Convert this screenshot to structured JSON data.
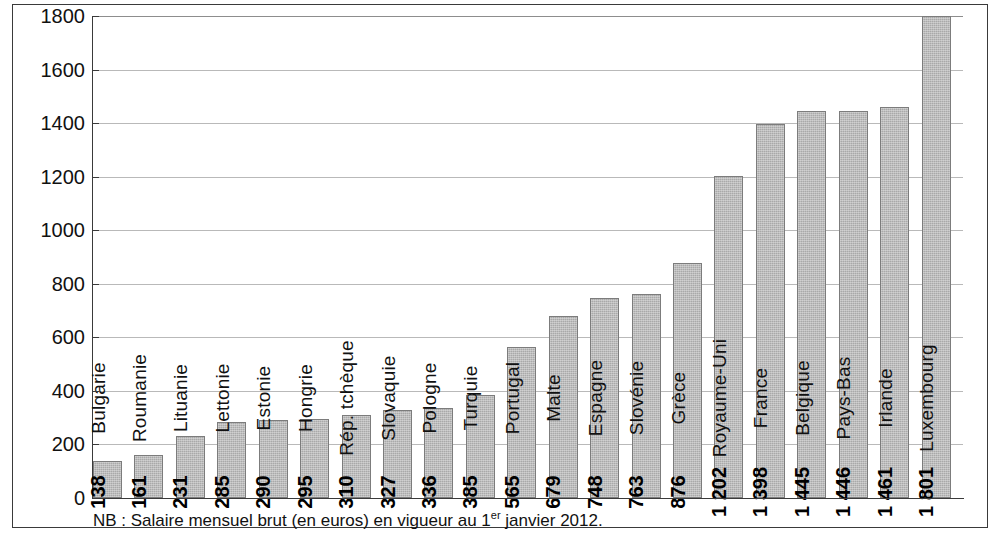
{
  "chart_data": {
    "type": "bar",
    "title": "",
    "subtitle": "",
    "xlabel": "",
    "ylabel": "",
    "ylim": [
      0,
      1800
    ],
    "ytick_step": 200,
    "yticks": [
      1800,
      1600,
      1400,
      1200,
      1000,
      800,
      600,
      400,
      200,
      0
    ],
    "ytick_labels": [
      "1800",
      "1600",
      "1400",
      "1200",
      "1000",
      "800",
      "600",
      "400",
      "200",
      "0"
    ],
    "grid": true,
    "grid_axis": "y",
    "legend": false,
    "bar_color": "#a9a9a9",
    "bar_edge_color": "#7c7c7c",
    "categories": [
      "Bulgarie",
      "Roumanie",
      "Lituanie",
      "Lettonie",
      "Estonie",
      "Hongrie",
      "Rép. tchèque",
      "Slovaquie",
      "Pologne",
      "Turquie",
      "Portugal",
      "Malte",
      "Espagne",
      "Slovénie",
      "Grèce",
      "Royaume-Uni",
      "France",
      "Belgique",
      "Pays-Bas",
      "Irlande",
      "Luxembourg"
    ],
    "values": [
      138,
      161,
      231,
      285,
      290,
      295,
      310,
      327,
      336,
      385,
      565,
      679,
      748,
      763,
      876,
      1202,
      1398,
      1445,
      1446,
      1461,
      1801
    ],
    "value_labels": [
      "138",
      "161",
      "231",
      "285",
      "290",
      "295",
      "310",
      "327",
      "336",
      "385",
      "565",
      "679",
      "748",
      "763",
      "876",
      "1 202",
      "1 398",
      "1 445",
      "1 446",
      "1 461",
      "1 801"
    ],
    "bars": [
      {
        "category": "Bulgarie",
        "value": 138,
        "label": "138"
      },
      {
        "category": "Roumanie",
        "value": 161,
        "label": "161"
      },
      {
        "category": "Lituanie",
        "value": 231,
        "label": "231"
      },
      {
        "category": "Lettonie",
        "value": 285,
        "label": "285"
      },
      {
        "category": "Estonie",
        "value": 290,
        "label": "290"
      },
      {
        "category": "Hongrie",
        "value": 295,
        "label": "295"
      },
      {
        "category": "Rép. tchèque",
        "value": 310,
        "label": "310"
      },
      {
        "category": "Slovaquie",
        "value": 327,
        "label": "327"
      },
      {
        "category": "Pologne",
        "value": 336,
        "label": "336"
      },
      {
        "category": "Turquie",
        "value": 385,
        "label": "385"
      },
      {
        "category": "Portugal",
        "value": 565,
        "label": "565"
      },
      {
        "category": "Malte",
        "value": 679,
        "label": "679"
      },
      {
        "category": "Espagne",
        "value": 748,
        "label": "748"
      },
      {
        "category": "Slovénie",
        "value": 763,
        "label": "763"
      },
      {
        "category": "Grèce",
        "value": 876,
        "label": "876"
      },
      {
        "category": "Royaume-Uni",
        "value": 1202,
        "label": "1 202"
      },
      {
        "category": "France",
        "value": 1398,
        "label": "1 398"
      },
      {
        "category": "Belgique",
        "value": 1445,
        "label": "1 445"
      },
      {
        "category": "Pays-Bas",
        "value": 1446,
        "label": "1 446"
      },
      {
        "category": "Irlande",
        "value": 1461,
        "label": "1 461"
      },
      {
        "category": "Luxembourg",
        "value": 1801,
        "label": "1 801"
      }
    ]
  },
  "note": {
    "prefix": "NB : Salaire mensuel brut (en euros) en vigueur au 1",
    "ordinal": "er",
    "suffix": " janvier 2012."
  }
}
